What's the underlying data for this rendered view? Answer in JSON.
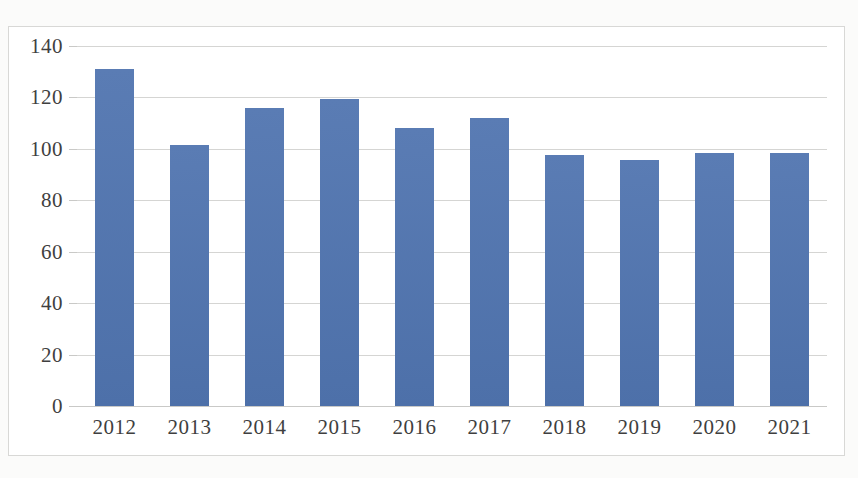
{
  "page": {
    "top_cut_text": "",
    "background_color": "#fbfbfa"
  },
  "chart": {
    "frame_border_color": "#d8d8d6",
    "plot_background_color": "#ffffff",
    "gridline_color": "#d5d5d3",
    "bar_color": "#5175ad",
    "axis_text_color": "#3f3f3f"
  },
  "chart_data": {
    "type": "bar",
    "title": "",
    "subtitle": "",
    "xlabel": "",
    "ylabel": "",
    "categories": [
      "2012",
      "2013",
      "2014",
      "2015",
      "2016",
      "2017",
      "2018",
      "2019",
      "2020",
      "2021"
    ],
    "values": [
      131,
      101.5,
      116,
      119.5,
      108,
      112,
      97.5,
      95.5,
      98.5,
      98.3
    ],
    "series": [
      {
        "name": "",
        "values": [
          131,
          101.5,
          116,
          119.5,
          108,
          112,
          97.5,
          95.5,
          98.5,
          98.3
        ]
      }
    ],
    "ylim": [
      0,
      140
    ],
    "yticks": [
      0,
      20,
      40,
      60,
      80,
      100,
      120,
      140
    ],
    "ytick_labels": [
      "0",
      "20",
      "40",
      "60",
      "80",
      "100",
      "120",
      "140"
    ],
    "xtick_labels": [
      "2012",
      "2013",
      "2014",
      "2015",
      "2016",
      "2017",
      "2018",
      "2019",
      "2020",
      "2021"
    ],
    "grid": true,
    "grid_axis": "y",
    "legend": false,
    "legend_position": "none",
    "annotations": [],
    "data_labels": false
  }
}
